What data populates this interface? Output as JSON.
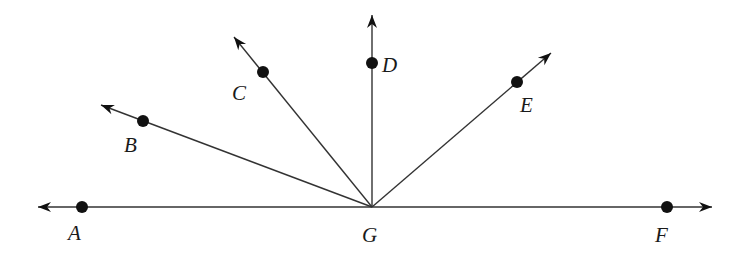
{
  "diagram": {
    "type": "rays-from-common-vertex",
    "vertex": {
      "label": "G",
      "x": 372,
      "y": 207
    },
    "line": {
      "through": [
        "A",
        "G",
        "F"
      ]
    },
    "rays": [
      {
        "id": "A",
        "label": "A",
        "point": [
          82,
          207
        ],
        "tip": [
          38,
          207
        ],
        "label_pos": [
          68,
          240
        ]
      },
      {
        "id": "B",
        "label": "B",
        "point": [
          143,
          121
        ],
        "tip": [
          101,
          105
        ],
        "label_pos": [
          124,
          152
        ]
      },
      {
        "id": "C",
        "label": "C",
        "point": [
          263,
          72
        ],
        "tip": [
          234,
          37
        ],
        "label_pos": [
          232,
          100
        ]
      },
      {
        "id": "D",
        "label": "D",
        "point": [
          372,
          63
        ],
        "tip": [
          372,
          15
        ],
        "label_pos": [
          382,
          72
        ]
      },
      {
        "id": "E",
        "label": "E",
        "point": [
          517,
          82
        ],
        "tip": [
          551,
          53
        ],
        "label_pos": [
          520,
          112
        ]
      },
      {
        "id": "F",
        "label": "F",
        "point": [
          667,
          207
        ],
        "tip": [
          712,
          207
        ],
        "label_pos": [
          655,
          242
        ]
      }
    ],
    "vertex_label_pos": [
      362,
      242
    ],
    "colors": {
      "line": "#333333",
      "point": "#111111",
      "text": "#1a1a1a"
    }
  }
}
